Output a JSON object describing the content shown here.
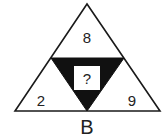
{
  "puzzle": {
    "top_value": "8",
    "left_value": "2",
    "right_value": "9",
    "center_value": "?",
    "label": "B"
  },
  "colors": {
    "stroke": "#1a1a1a",
    "fill_center": "#111111",
    "background": "#ffffff"
  }
}
